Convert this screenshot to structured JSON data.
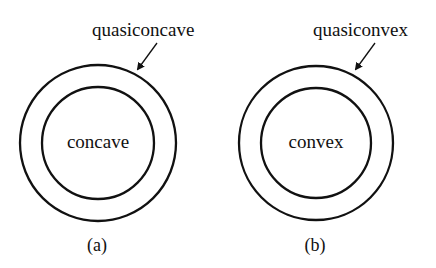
{
  "figure": {
    "panels": [
      {
        "id": "a",
        "caption": "(a)",
        "inner_label": "concave",
        "outer_label": "quasiconcave",
        "center": [
          98,
          143
        ],
        "outer_radius": 78,
        "inner_radius": 56
      },
      {
        "id": "b",
        "caption": "(b)",
        "inner_label": "convex",
        "outer_label": "quasiconvex",
        "center": [
          316,
          143
        ],
        "outer_radius": 77,
        "inner_radius": 55
      }
    ],
    "colors": {
      "stroke": "#111111",
      "background": "#ffffff"
    }
  }
}
